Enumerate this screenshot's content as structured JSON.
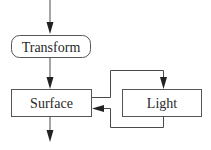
{
  "diagram": {
    "nodes": [
      {
        "id": "transform",
        "label": "Transform",
        "shape": "rounded-rect"
      },
      {
        "id": "surface",
        "label": "Surface",
        "shape": "rect"
      },
      {
        "id": "light",
        "label": "Light",
        "shape": "rect"
      }
    ],
    "edges": [
      {
        "from": "input",
        "to": "transform"
      },
      {
        "from": "transform",
        "to": "surface"
      },
      {
        "from": "surface",
        "to": "light"
      },
      {
        "from": "light",
        "to": "surface"
      },
      {
        "from": "surface",
        "to": "output"
      }
    ],
    "colors": {
      "stroke": "#555555",
      "text": "#2a2a2a",
      "background": "#ffffff"
    }
  }
}
